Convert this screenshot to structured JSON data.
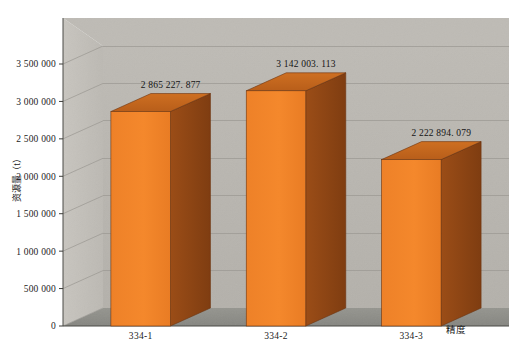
{
  "chart_data": {
    "type": "bar",
    "title": "",
    "subtitle": "",
    "xlabel": "精度",
    "ylabel": "资源量（t）",
    "categories": [
      "334-1",
      "334-2",
      "334-3"
    ],
    "values": [
      2865227.877,
      3142003.113,
      2222894.079
    ],
    "value_labels": [
      "2 865 227. 877",
      "3 142 003. 113",
      "2 222 894. 079"
    ],
    "series": [
      {
        "name": "资源量",
        "values": [
          2865227.877,
          3142003.113,
          2222894.079
        ]
      }
    ],
    "ylim": [
      0,
      3500000
    ],
    "ytick_values": [
      0,
      500000,
      1000000,
      1500000,
      2000000,
      2500000,
      3000000,
      3500000
    ],
    "ytick_labels": [
      "0",
      "500 000",
      "1 000 000",
      "1 500 000",
      "2 000 000",
      "2 500 000",
      "3 000 000",
      "3 500 000"
    ],
    "grid": true,
    "legend": false,
    "legend_position": "none",
    "perspective_3d": true,
    "colors": {
      "bar_front": "#F08229",
      "bar_side": "#8E4514",
      "bar_top": "#C1671D",
      "bar_edge": "#6B3410",
      "back_wall": "#BAB7B1",
      "left_wall": "#C3C0BA",
      "floor": "#8C8C87",
      "gridline": "#9A9791",
      "axis_line": "#4A4A46",
      "page_background": "#FFFFFF",
      "text": "#1C1C1C"
    }
  },
  "figure": {
    "background_label": "chart-canvas"
  }
}
